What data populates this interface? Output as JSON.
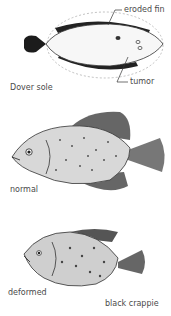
{
  "figure": {
    "panels": [
      {
        "id": "dover-sole",
        "species_label": "Dover sole",
        "callouts": [
          "eroded fin",
          "tumor"
        ]
      },
      {
        "id": "crappie-normal",
        "label": "normal"
      },
      {
        "id": "crappie-deformed",
        "label": "deformed",
        "species_label": "black crappie"
      }
    ]
  }
}
